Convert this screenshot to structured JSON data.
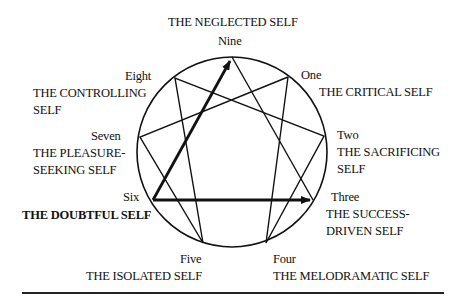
{
  "diagram": {
    "points": [
      {
        "number": "Nine",
        "type": "THE NEGLECTED SELF"
      },
      {
        "number": "One",
        "type": "THE CRITICAL SELF"
      },
      {
        "number": "Two",
        "type": "THE SACRIFICING SELF"
      },
      {
        "number": "Three",
        "type": "THE SUCCESS-DRIVEN SELF"
      },
      {
        "number": "Four",
        "type": "THE MELODRAMATIC SELF"
      },
      {
        "number": "Five",
        "type": "THE ISOLATED SELF"
      },
      {
        "number": "Six",
        "type": "THE DOUBTFUL SELF"
      },
      {
        "number": "Seven",
        "type": "THE PLEASURE-SEEKING SELF"
      },
      {
        "number": "Eight",
        "type": "THE CONTROLLING SELF"
      }
    ],
    "labels": {
      "nine_num": "Nine",
      "nine_type": "THE NEGLECTED SELF",
      "one_num": "One",
      "one_type": "THE CRITICAL SELF",
      "two_num": "Two",
      "two_type_1": "THE SACRIFICING",
      "two_type_2": "SELF",
      "three_num": "Three",
      "three_type_1": "THE SUCCESS-",
      "three_type_2": "DRIVEN SELF",
      "four_num": "Four",
      "four_type": "THE MELODRAMATIC SELF",
      "five_num": "Five",
      "five_type": "THE ISOLATED SELF",
      "six_num": "Six",
      "six_type": "THE DOUBTFUL SELF",
      "seven_num": "Seven",
      "seven_type_1": "THE PLEASURE-",
      "seven_type_2": "SEEKING SELF",
      "eight_num": "Eight",
      "eight_type_1": "THE CONTROLLING",
      "eight_type_2": "SELF"
    },
    "highlighted_arrows": [
      "Six -> Nine",
      "Six -> Three"
    ],
    "highlighted_point": "Six"
  }
}
